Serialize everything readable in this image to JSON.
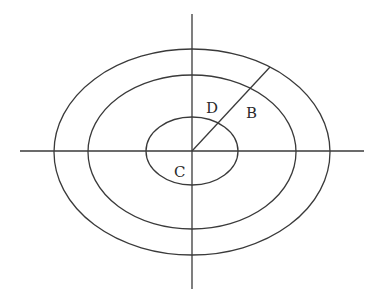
{
  "diagram": {
    "labels": {
      "D": "D",
      "B": "B",
      "C": "C"
    },
    "center": {
      "x": 192,
      "y": 151
    },
    "axes": {
      "horizontal": {
        "x1": 20,
        "x2": 364,
        "y": 151
      },
      "vertical": {
        "x": 192,
        "y1": 14,
        "y2": 289
      }
    },
    "ellipses": [
      {
        "name": "inner",
        "rx": 46,
        "ry": 34
      },
      {
        "name": "middle",
        "rx": 104,
        "ry": 77
      },
      {
        "name": "outer",
        "rx": 138,
        "ry": 103
      }
    ],
    "radial_line": {
      "x1": 192,
      "y1": 151,
      "x2": 270,
      "y2": 67
    },
    "stroke_color": "#3a3a3a",
    "background": "#ffffff"
  }
}
